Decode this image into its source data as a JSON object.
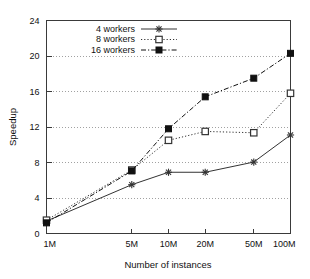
{
  "chart_data": {
    "type": "line",
    "title": "",
    "xlabel": "Number of instances",
    "ylabel": "Speedup",
    "x": [
      1,
      5,
      10,
      20,
      50,
      100
    ],
    "categories": [
      "1M",
      "5M",
      "10M",
      "20M",
      "50M",
      "100M"
    ],
    "xscale": "log",
    "xlim": [
      1,
      100
    ],
    "ylim": [
      0,
      24
    ],
    "yticks": [
      0,
      4,
      8,
      12,
      16,
      20,
      24
    ],
    "ytick_labels": [
      "0",
      "4",
      "8",
      "12",
      "16",
      "20",
      "24"
    ],
    "xtick_labels": [
      "1M",
      "5M",
      "10M",
      "20M",
      "50M",
      "100M"
    ],
    "grid": "horizontal-dotted",
    "legend_position": "upper-left-inside",
    "series": [
      {
        "name": "4 workers",
        "values": [
          1.4,
          5.5,
          6.9,
          6.9,
          8.05,
          11.1
        ],
        "marker": "star",
        "line_style": "solid",
        "color": "#333333"
      },
      {
        "name": "8 workers",
        "values": [
          1.5,
          7.15,
          10.5,
          11.5,
          11.35,
          15.8
        ],
        "marker": "open-square",
        "line_style": "dotted",
        "color": "#333333"
      },
      {
        "name": "16 workers",
        "values": [
          1.2,
          7.05,
          11.8,
          15.4,
          17.5,
          20.3
        ],
        "marker": "filled-square",
        "line_style": "dash-dot",
        "color": "#111111"
      }
    ]
  },
  "axes": {
    "x_title": "Number of instances",
    "y_title": "Speedup"
  },
  "legend": {
    "entries": [
      {
        "label": "4 workers"
      },
      {
        "label": "8 workers"
      },
      {
        "label": "16 workers"
      }
    ]
  },
  "colors": {
    "frame": "#3a3a3a",
    "grid": "#8a8a8a",
    "text": "#111111",
    "series_4": "#333333",
    "series_8": "#333333",
    "series_16": "#111111"
  }
}
